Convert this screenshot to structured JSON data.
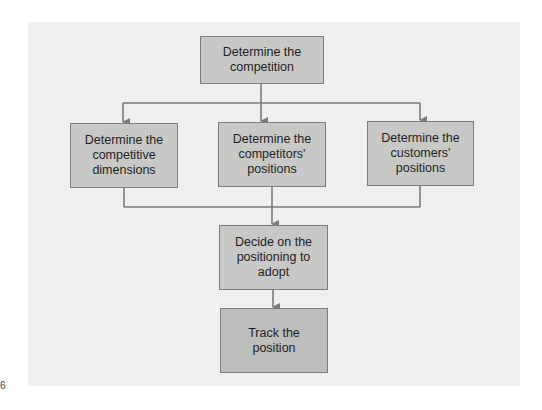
{
  "diagram": {
    "type": "flowchart",
    "colors": {
      "panel": "#efefee",
      "node_fill": "#c8c8c7",
      "node_border": "#7c7c7c",
      "connector": "#7a7a7a"
    },
    "nodes": [
      {
        "id": "competition",
        "label": "Determine the competition"
      },
      {
        "id": "dimensions",
        "label": "Determine the competitive dimensions"
      },
      {
        "id": "competitors",
        "label": "Determine the competitors' positions"
      },
      {
        "id": "customers",
        "label": "Determine the customers' positions"
      },
      {
        "id": "decide",
        "label": "Decide on the positioning to adopt"
      },
      {
        "id": "track",
        "label": "Track the position"
      }
    ],
    "edges": [
      [
        "competition",
        "dimensions"
      ],
      [
        "competition",
        "competitors"
      ],
      [
        "competition",
        "customers"
      ],
      [
        "dimensions",
        "decide"
      ],
      [
        "competitors",
        "decide"
      ],
      [
        "customers",
        "decide"
      ],
      [
        "decide",
        "track"
      ]
    ]
  },
  "page_number_fragment": "6"
}
